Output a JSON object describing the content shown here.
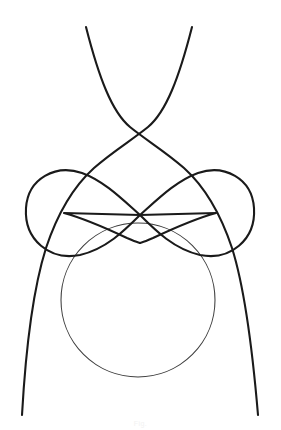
{
  "page": {
    "background_color": "#ffffff",
    "width": 281,
    "height": 430
  },
  "figure": {
    "name": "roulette-curve-figure",
    "stroke_color_heavy": "#1a1a1a",
    "stroke_color_light": "#3d3d3d",
    "stroke_width_heavy": 2.1,
    "stroke_width_light": 1.05
  },
  "caption": {
    "text": "Fig."
  },
  "chart_data": {
    "type": "line",
    "title": "",
    "xlabel": "",
    "ylabel": "",
    "grid": false,
    "legend_position": "none",
    "xlim": [
      0,
      281
    ],
    "ylim": [
      430,
      0
    ],
    "annotations": [
      {
        "label": "top-crossing-node",
        "x": 140,
        "y": 133
      },
      {
        "label": "central-node",
        "x": 140,
        "y": 215
      },
      {
        "label": "lower-center-node",
        "x": 140,
        "y": 243
      },
      {
        "label": "left-lobe-tip",
        "x": 64,
        "y": 214
      },
      {
        "label": "right-lobe-tip",
        "x": 216,
        "y": 214
      },
      {
        "label": "left-lower-node",
        "x": 75,
        "y": 330
      },
      {
        "label": "right-lower-node",
        "x": 205,
        "y": 330
      }
    ],
    "series": [
      {
        "name": "descending-arc-left-to-right",
        "stroke": "#1a1a1a",
        "weight": "heavy",
        "path": "M 86,27 C 100,90 118,120 140,133 C 168,150 196,170 214,196 C 236,228 250,290 258,415"
      },
      {
        "name": "descending-arc-right-to-left",
        "stroke": "#1a1a1a",
        "weight": "heavy",
        "path": "M 192,27 C 178,90 160,120 140,133 C 112,150 84,170 66,196 C 44,228 30,290 22,415"
      },
      {
        "name": "left-lobe-loop",
        "stroke": "#1a1a1a",
        "weight": "heavy",
        "path": "M 140,215 C 118,202 100,182 76,174 C 46,164 25,186 25,212 C 25,240 48,260 76,254 C 104,248 124,232 140,215"
      },
      {
        "name": "right-lobe-loop",
        "stroke": "#1a1a1a",
        "weight": "heavy",
        "path": "M 140,215 C 162,202 180,182 204,174 C 234,164 255,186 255,212 C 255,240 232,260 204,254 C 176,248 156,232 140,215"
      },
      {
        "name": "bowtie-left-wing",
        "stroke": "#1a1a1a",
        "weight": "heavy",
        "path": "M 140,215 L 64,214 C 92,222 118,234 140,243"
      },
      {
        "name": "bowtie-right-wing",
        "stroke": "#1a1a1a",
        "weight": "heavy",
        "path": "M 140,215 L 216,214 C 188,222 162,234 140,243"
      },
      {
        "name": "circle",
        "stroke": "#3d3d3d",
        "weight": "light",
        "center": [
          138,
          300
        ],
        "radius": 77
      }
    ]
  }
}
